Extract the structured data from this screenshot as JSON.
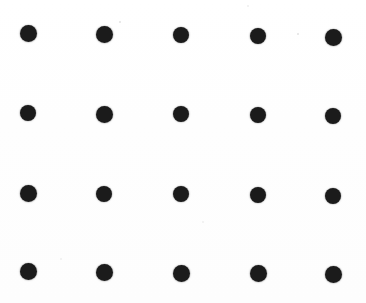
{
  "image": {
    "title": "Dot Grid Pattern",
    "kind": "scanned-dot-grid",
    "width": 366,
    "height": 303,
    "background_color": "#fdfdfd",
    "dot_color": "#1b1b1b",
    "grid": {
      "rows": 4,
      "columns": 5,
      "total_dots": 20,
      "dot_diameter": 17,
      "column_centers_x": [
        28,
        104,
        181,
        258,
        333
      ],
      "row_centers_y": [
        33,
        114,
        194,
        272
      ]
    },
    "dots": [
      {
        "row": 1,
        "col": 1,
        "cx": 28,
        "cy": 33,
        "d": 17
      },
      {
        "row": 1,
        "col": 2,
        "cx": 104,
        "cy": 34,
        "d": 17
      },
      {
        "row": 1,
        "col": 3,
        "cx": 181,
        "cy": 35,
        "d": 16
      },
      {
        "row": 1,
        "col": 4,
        "cx": 258,
        "cy": 36,
        "d": 16
      },
      {
        "row": 1,
        "col": 5,
        "cx": 333,
        "cy": 37,
        "d": 17
      },
      {
        "row": 2,
        "col": 1,
        "cx": 28,
        "cy": 113,
        "d": 16
      },
      {
        "row": 2,
        "col": 2,
        "cx": 104,
        "cy": 114,
        "d": 17
      },
      {
        "row": 2,
        "col": 3,
        "cx": 181,
        "cy": 114,
        "d": 16
      },
      {
        "row": 2,
        "col": 4,
        "cx": 258,
        "cy": 115,
        "d": 16
      },
      {
        "row": 2,
        "col": 5,
        "cx": 333,
        "cy": 116,
        "d": 16
      },
      {
        "row": 3,
        "col": 1,
        "cx": 28,
        "cy": 193,
        "d": 17
      },
      {
        "row": 3,
        "col": 2,
        "cx": 104,
        "cy": 194,
        "d": 16
      },
      {
        "row": 3,
        "col": 3,
        "cx": 181,
        "cy": 194,
        "d": 16
      },
      {
        "row": 3,
        "col": 4,
        "cx": 258,
        "cy": 195,
        "d": 16
      },
      {
        "row": 3,
        "col": 5,
        "cx": 333,
        "cy": 196,
        "d": 16
      },
      {
        "row": 4,
        "col": 1,
        "cx": 28,
        "cy": 271,
        "d": 17
      },
      {
        "row": 4,
        "col": 2,
        "cx": 104,
        "cy": 272,
        "d": 17
      },
      {
        "row": 4,
        "col": 3,
        "cx": 181,
        "cy": 273,
        "d": 17
      },
      {
        "row": 4,
        "col": 4,
        "cx": 258,
        "cy": 273,
        "d": 17
      },
      {
        "row": 4,
        "col": 5,
        "cx": 333,
        "cy": 274,
        "d": 17
      }
    ],
    "specks": [
      {
        "cx": 120,
        "cy": 22,
        "d": 2.5,
        "level": "faint"
      },
      {
        "cx": 298,
        "cy": 34,
        "d": 2.5,
        "level": "faint"
      },
      {
        "cx": 203,
        "cy": 222,
        "d": 2.5,
        "level": "vfaint"
      },
      {
        "cx": 61,
        "cy": 259,
        "d": 2,
        "level": "vfaint"
      },
      {
        "cx": 248,
        "cy": 6,
        "d": 2,
        "level": "vfaint"
      }
    ]
  }
}
